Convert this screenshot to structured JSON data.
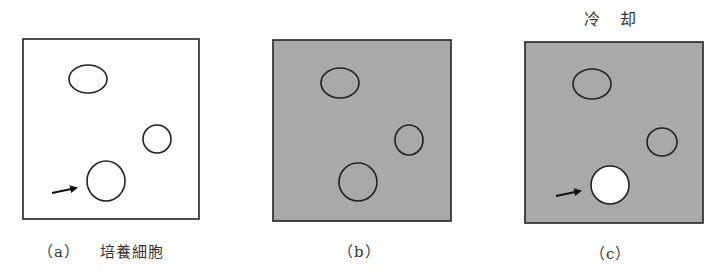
{
  "figure": {
    "panels": [
      {
        "id": "a",
        "label": "（a）",
        "caption": "培養細胞",
        "background": "#ffffff",
        "cells": [
          {
            "cx": 88,
            "cy": 79,
            "rx": 19,
            "ry": 14,
            "fill": "none"
          },
          {
            "cx": 157,
            "cy": 139,
            "rx": 14,
            "ry": 14,
            "fill": "none"
          },
          {
            "cx": 106,
            "cy": 181,
            "rx": 19,
            "ry": 20,
            "fill": "none"
          }
        ],
        "arrow": {
          "x1": 52,
          "y1": 193,
          "x2": 78,
          "y2": 188
        }
      },
      {
        "id": "b",
        "label": "（b）",
        "caption": "",
        "background": "#a9a9a9",
        "cells": [
          {
            "cx": 340,
            "cy": 83,
            "rx": 19,
            "ry": 15,
            "fill": "none"
          },
          {
            "cx": 409,
            "cy": 140,
            "rx": 14,
            "ry": 15,
            "fill": "none"
          },
          {
            "cx": 358,
            "cy": 182,
            "rx": 19,
            "ry": 19,
            "fill": "none"
          }
        ]
      },
      {
        "id": "c",
        "label": "（c）",
        "title": "冷　却",
        "caption": "",
        "background": "#a9a9a9",
        "cells": [
          {
            "cx": 592,
            "cy": 84,
            "rx": 19,
            "ry": 15,
            "fill": "none"
          },
          {
            "cx": 662,
            "cy": 142,
            "rx": 15,
            "ry": 14,
            "fill": "none"
          },
          {
            "cx": 610,
            "cy": 185,
            "rx": 19,
            "ry": 19,
            "fill": "#ffffff"
          }
        ],
        "arrow": {
          "x1": 556,
          "y1": 196,
          "x2": 582,
          "y2": 191
        }
      }
    ]
  }
}
